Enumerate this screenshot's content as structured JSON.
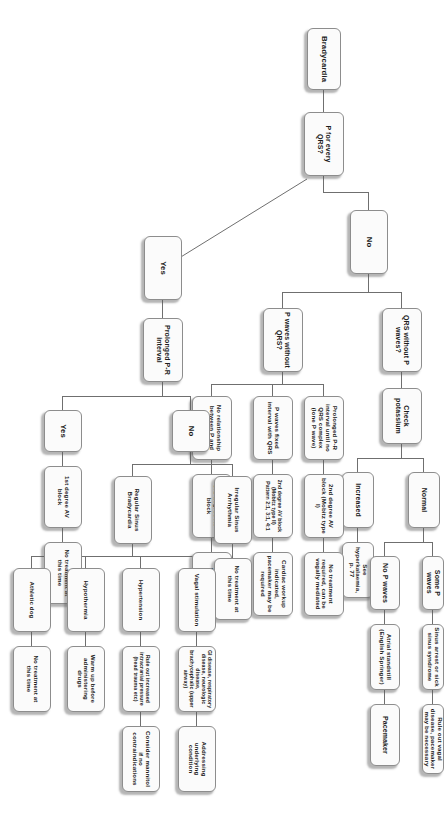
{
  "diagram": {
    "title": "Bradycardia",
    "type": "clinical-decision-flowchart",
    "nodes": {
      "root": "Bradycardia",
      "q_p_for_every_qrs": "P for every QRS?",
      "branch_no": "No",
      "branch_yes": "Yes",
      "qrs_without_p": "QRS without P waves?",
      "check_potassium": "Check potassium",
      "potassium_normal": "Normal",
      "potassium_increased": "Increased",
      "see_hyperkalaemia": "See hyperkalaemia, p. 77",
      "some_p_waves": "Some P waves",
      "sinus_arrest": "Sinus arrest or sick sinus syndrome",
      "rule_out_vagal": "Rule out vagal disease, pacemaker may be necessary",
      "no_p_waves": "No P waves",
      "atrial_standstill": "Atrial standstill (English Springer)",
      "pacemaker": "Pacemaker",
      "p_waves_without_qrs": "P waves without QRS?",
      "prolonged_pr_until_no_qrs": "Prolonged P-R interval until no QRS complex (lone P wave)",
      "second_degree_mobitz_i": "2nd degree AV block (Mobitz type I)",
      "no_treatment_vagally": "No treatment required, can be vagally mediated",
      "p_waves_fixed_interval": "P waves fixed interval with QRS",
      "second_degree_mobitz_ii": "2nd degree AV block (Mobitz type II) Pattern 2:1, 3:1, 4:1",
      "cardiac_workup": "Cardiac workup indicated, pacemaker may be required",
      "no_relationship": "No relationship between P and QRS",
      "third_degree_av_block": "3rd degree AV block",
      "emergency_pacemaker": "Emergency pacemaker required",
      "prolonged_pr_interval": "Prolonged P-R interval",
      "pr_no": "No",
      "pr_yes": "Yes",
      "first_degree_av_block": "1st degree AV block",
      "no_treatment_at_this_time_1": "No treatment at this time",
      "irregular_sinus_arrhythmia": "Irregular Sinus Arrhythmia",
      "no_treatment_at_this_time_2": "No treatment at this time",
      "regular_sinus_bradycardia": "Regular Sinus Bradycardia",
      "vagal_stimulation": "Vagal stimulation",
      "gi_disease": "GI disease, respiratory disease, neurologic disease, brachycephalic (upper airway)",
      "addressing_underlying": "Addressing underlying condition",
      "hypertension": "Hypertension",
      "rule_out_icp": "Rule out increased intracranial pressure (head trauma etc)",
      "consider_mannitol": "Consider mannitol if no contraindications",
      "hypothermia": "Hypothermia",
      "warm_up": "Warm up before administering drugs",
      "athletic_dog": "Athletic dog",
      "no_treatment_at_this_time_3": "No treatment at this time"
    },
    "colors": {
      "node_fill": "#fbfbfb",
      "node_border": "#8d8d8d",
      "connector": "#6f6f6f",
      "text": "#1c1c1c",
      "background": "#ffffff"
    }
  }
}
